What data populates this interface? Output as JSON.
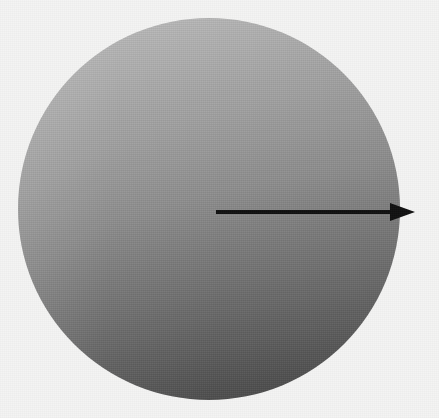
{
  "figure": {
    "kind": "gradient-disk-with-scale-arrow",
    "width": 439,
    "height": 418,
    "background_color": "#f4f4f3"
  },
  "disk": {
    "name": "gradient-disk",
    "shape": "circle",
    "center_x": 209,
    "center_y": 209,
    "diameter": 382,
    "gradient": {
      "direction": "top-to-bottom",
      "angle_deg": 172,
      "light_color": "#c0c0c0",
      "mid_color": "#8f8f8f",
      "dark_color": "#454545"
    }
  },
  "scale_bar": {
    "name": "scale-arrow",
    "arrow_color": "#111111",
    "start_x": 216,
    "end_x": 415,
    "y": 212,
    "line_thickness": 4,
    "arrowhead": {
      "tip_x": 415,
      "base_x": 391,
      "half_height": 9
    },
    "start_label": "0",
    "end_label": "100"
  }
}
